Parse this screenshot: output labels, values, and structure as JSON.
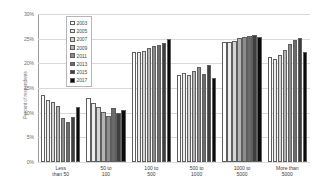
{
  "chart_data": {
    "type": "bar",
    "title": "",
    "xlabel": "",
    "ylabel": "Percent of respondents",
    "ylim": [
      0,
      30
    ],
    "yticks": [
      "0%",
      "5%",
      "10%",
      "15%",
      "20%",
      "25%",
      "30%"
    ],
    "ytick_values": [
      0,
      5,
      10,
      15,
      20,
      25,
      30
    ],
    "grid": true,
    "legend_position": "upper-left-inside",
    "categories": [
      "Less\nthan 50",
      "50 to\n100",
      "100 to\n500",
      "500 to\n1000",
      "1000 to\n5000",
      "More than\n5000"
    ],
    "series": [
      {
        "name": "2003",
        "color": "#ffffff",
        "values": [
          13.6,
          12.9,
          22.2,
          17.7,
          24.3,
          21.3
        ]
      },
      {
        "name": "2005",
        "color": "#ececec",
        "values": [
          12.5,
          11.9,
          22.3,
          18.1,
          24.4,
          20.8
        ]
      },
      {
        "name": "2007",
        "color": "#d4d4d4",
        "values": [
          12.2,
          11.1,
          22.6,
          17.6,
          24.6,
          21.7
        ]
      },
      {
        "name": "2009",
        "color": "#b4b4b4",
        "values": [
          11.3,
          10.1,
          23.1,
          18.4,
          25.2,
          22.8
        ]
      },
      {
        "name": "2011",
        "color": "#8c8c8c",
        "values": [
          9.0,
          9.4,
          23.5,
          19.3,
          25.4,
          24.0
        ]
      },
      {
        "name": "2013",
        "color": "#6b6b6b",
        "values": [
          8.2,
          11.0,
          23.8,
          17.9,
          25.6,
          24.7
        ]
      },
      {
        "name": "2015",
        "color": "#3f3f3f",
        "values": [
          9.2,
          9.9,
          24.2,
          19.6,
          25.8,
          25.2
        ]
      },
      {
        "name": "2017",
        "color": "#0a0a0a",
        "values": [
          11.1,
          10.6,
          24.9,
          17.1,
          25.3,
          22.3
        ]
      }
    ]
  }
}
